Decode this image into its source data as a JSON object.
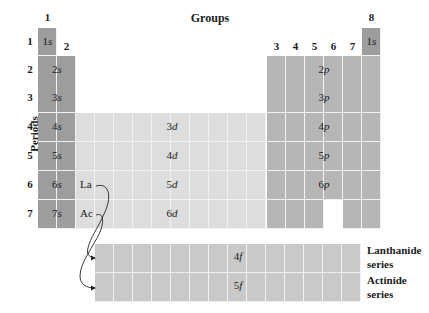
{
  "title": "Groups",
  "axis_label": "Periods",
  "group_labels": [
    "1",
    "2",
    "3",
    "4",
    "5",
    "6",
    "7",
    "8"
  ],
  "period_labels": [
    "1",
    "2",
    "3",
    "4",
    "5",
    "6",
    "7"
  ],
  "s_block": [
    "1s",
    "2s",
    "3s",
    "4s",
    "5s",
    "6s",
    "7s"
  ],
  "noble_1s": "1s",
  "p_block": [
    "2p",
    "3p",
    "4p",
    "5p",
    "6p"
  ],
  "d_block": [
    "3d",
    "4d",
    "5d",
    "6d"
  ],
  "f_block": [
    "4f",
    "5f"
  ],
  "elements": {
    "la": "La",
    "ac": "Ac"
  },
  "series": {
    "lanthanide_1": "Lanthanide",
    "lanthanide_2": "series",
    "actinide_1": "Actinide",
    "actinide_2": "series"
  },
  "colors": {
    "s_block": "#9d9d9d",
    "p_block": "#b6b6b6",
    "d_block": "#dddddd",
    "f_block": "#c9c9c9"
  }
}
